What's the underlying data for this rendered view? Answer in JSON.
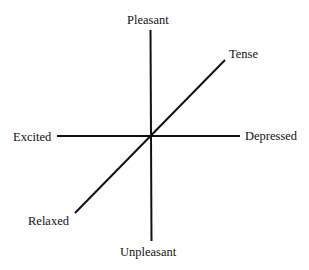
{
  "diagram": {
    "type": "three-axis mood diagram",
    "labels": {
      "pleasant": "Pleasant",
      "unpleasant": "Unpleasant",
      "excited": "Excited",
      "depressed": "Depressed",
      "tense": "Tense",
      "relaxed": "Relaxed"
    },
    "axes": [
      {
        "name": "pleasant-unpleasant",
        "from": "Pleasant",
        "to": "Unpleasant"
      },
      {
        "name": "excited-depressed",
        "from": "Excited",
        "to": "Depressed"
      },
      {
        "name": "tense-relaxed",
        "from": "Tense",
        "to": "Relaxed"
      }
    ],
    "line_color": "#111111"
  }
}
